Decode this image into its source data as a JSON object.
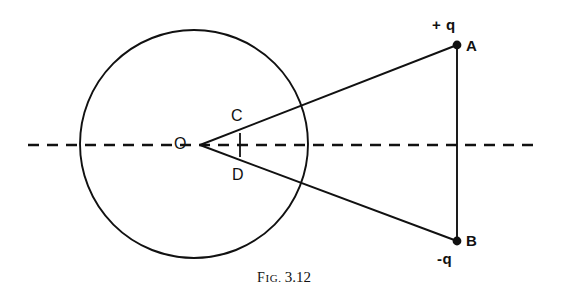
{
  "figure": {
    "caption_prefix_first": "F",
    "caption_prefix_rest": "IG.",
    "caption_number": "3.12",
    "caption_full": "FIG. 3.12"
  },
  "colors": {
    "ink": "#111111",
    "background": "#ffffff"
  },
  "labels": {
    "center": "O",
    "upper_intercept": "C",
    "lower_intercept": "D",
    "point_a": "A",
    "point_b": "B",
    "charge_positive": "+ q",
    "charge_negative": "-q"
  },
  "geometry": {
    "circle": {
      "cx": 194,
      "cy": 144,
      "r": 114
    },
    "axis": {
      "y": 145,
      "x_start": 28,
      "x_end": 540,
      "style": "dashed"
    },
    "vertex": {
      "x": 200,
      "y": 145
    },
    "point_a": {
      "x": 457,
      "y": 45
    },
    "point_b": {
      "x": 457,
      "y": 241
    },
    "segment_cd": {
      "x": 240,
      "y_top": 133,
      "y_bottom": 157
    }
  }
}
